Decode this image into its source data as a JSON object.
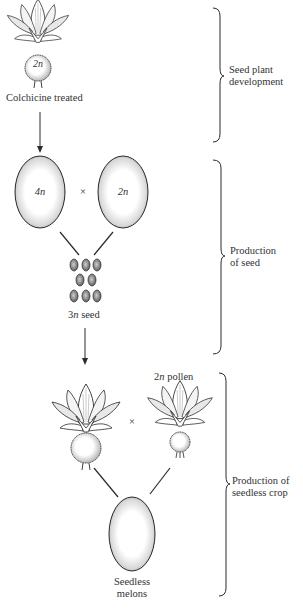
{
  "stage1": {
    "plant_label": "2n",
    "caption": "Colchicine treated",
    "bracket_label_line1": "Seed plant",
    "bracket_label_line2": "development"
  },
  "stage2": {
    "melon_left_label": "4n",
    "cross_symbol": "×",
    "melon_right_label": "2n",
    "seed_label_prefix": "3",
    "seed_label_n": "n",
    "seed_label_suffix": " seed",
    "bracket_label_line1": "Production",
    "bracket_label_line2": "of seed"
  },
  "stage3": {
    "pollen_label_prefix": "2",
    "pollen_label_n": "n",
    "pollen_label_suffix": " pollen",
    "cross_symbol": "×",
    "result_line1": "Seedless",
    "result_line2": "melons",
    "bracket_label_line1": "Production of",
    "bracket_label_line2": "seedless crop"
  },
  "colors": {
    "ink": "#2a2a2a",
    "stipple": "#b5b5b5",
    "background": "#ffffff"
  }
}
